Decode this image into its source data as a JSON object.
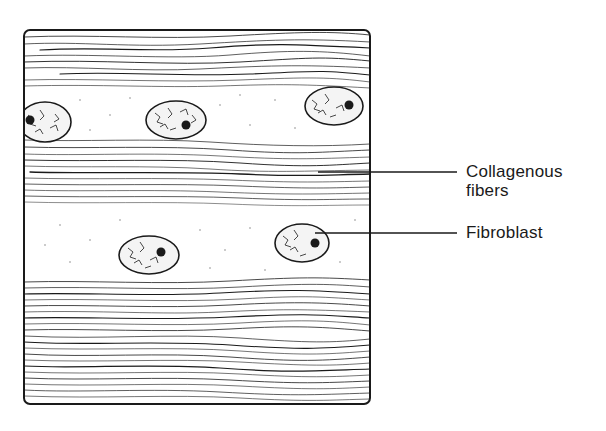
{
  "figure": {
    "type": "histology-schematic",
    "colors": {
      "ink": "#1a1a1a",
      "background": "#ffffff",
      "stipple": "#8a8a8a"
    }
  },
  "labels": {
    "collagenous_fibers_line1": "Collagenous",
    "collagenous_fibers_line2": "fibers",
    "fibroblast": "Fibroblast"
  },
  "annotations": [
    {
      "id": "collagenous-fibers",
      "text": "Collagenous fibers",
      "leader_from": [
        318,
        172
      ],
      "leader_to": [
        457,
        172
      ]
    },
    {
      "id": "fibroblast",
      "text": "Fibroblast",
      "leader_from": [
        315,
        233
      ],
      "leader_to": [
        457,
        233
      ]
    }
  ],
  "cells": [
    {
      "cx": 45,
      "cy": 122,
      "rx": 26,
      "ry": 20,
      "nucleolus": [
        30,
        120
      ]
    },
    {
      "cx": 176,
      "cy": 120,
      "rx": 30,
      "ry": 19,
      "nucleolus": [
        186,
        125
      ]
    },
    {
      "cx": 334,
      "cy": 106,
      "rx": 29,
      "ry": 19,
      "nucleolus": [
        349,
        105
      ]
    },
    {
      "cx": 149,
      "cy": 255,
      "rx": 30,
      "ry": 19,
      "nucleolus": [
        161,
        252
      ]
    },
    {
      "cx": 302,
      "cy": 243,
      "rx": 27,
      "ry": 19,
      "nucleolus": [
        315,
        243
      ]
    }
  ]
}
